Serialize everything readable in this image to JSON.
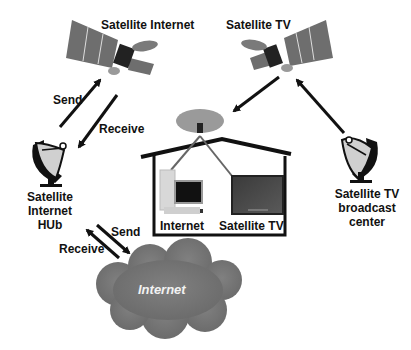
{
  "diagram": {
    "nodes": {
      "satellite_internet": {
        "label": "Satellite Internet"
      },
      "satellite_tv": {
        "label": "Satellite TV"
      },
      "internet_hub": {
        "label_lines": [
          "Satellite",
          "Internet",
          "HUb"
        ]
      },
      "broadcast_center": {
        "label_lines": [
          "Satellite TV",
          "broadcast",
          "center"
        ]
      },
      "house": {
        "internet_label": "Internet",
        "tv_label": "Satellite TV"
      },
      "cloud": {
        "label": "Internet"
      }
    },
    "edges": {
      "hub_to_sat_send": "Send",
      "sat_to_hub_receive": "Receive",
      "hub_to_cloud_send": "Send",
      "cloud_to_hub_receive": "Receive"
    },
    "colors": {
      "arrow": "#111111",
      "satellite_panel": "#6e6e6e",
      "dish_house": "#9a9a9a",
      "cloud": "#7a7a7a",
      "cloud_text": "#f2f2f2"
    }
  }
}
